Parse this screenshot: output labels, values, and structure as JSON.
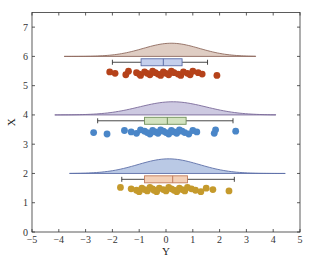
{
  "chart_data": {
    "type": "raincloud",
    "title": "",
    "xlabel": "Y",
    "ylabel": "X",
    "xlim": [
      -5,
      5
    ],
    "ylim": [
      0,
      7.5
    ],
    "xticks": [
      -5,
      -4,
      -3,
      -2,
      -1,
      0,
      1,
      2,
      3,
      4,
      5
    ],
    "yticks": [
      0,
      1,
      2,
      3,
      4,
      5,
      6,
      7
    ],
    "grid": false,
    "legend": null,
    "series": [
      {
        "name": "group-1",
        "baseline": 2,
        "box_y": 1.8,
        "dots_y": 1.45,
        "density_color": "#aebfe0",
        "density_edge": "#5d6fa8",
        "box_fill": "#f4d1b8",
        "box_edge": "#c07a5a",
        "dot_color": "#c59a2c",
        "density": {
          "x_min": -3.6,
          "x_max": 4.45,
          "mu": 0.1,
          "sigma": 1.15,
          "peak": 0.5
        },
        "box": {
          "whisker_low": -1.65,
          "q1": -0.8,
          "median": 0.25,
          "q3": 0.8,
          "whisker_high": 2.55
        },
        "points": [
          -1.7,
          -1.3,
          -1.1,
          -1.0,
          -0.9,
          -0.8,
          -0.7,
          -0.6,
          -0.5,
          -0.45,
          -0.35,
          -0.25,
          -0.1,
          0.0,
          0.1,
          0.2,
          0.3,
          0.4,
          0.5,
          0.6,
          0.7,
          0.8,
          0.95,
          1.1,
          1.3,
          1.5,
          1.75,
          2.35
        ]
      },
      {
        "name": "group-2",
        "baseline": 4,
        "box_y": 3.8,
        "dots_y": 3.42,
        "density_color": "#c4c0dc",
        "density_edge": "#7a6a9a",
        "box_fill": "#d3e3c0",
        "box_edge": "#6f8f5a",
        "dot_color": "#4a86c8",
        "density": {
          "x_min": -4.15,
          "x_max": 4.1,
          "mu": 0.25,
          "sigma": 1.25,
          "peak": 0.45
        },
        "box": {
          "whisker_low": -2.55,
          "q1": -0.8,
          "median": 0.05,
          "q3": 0.75,
          "whisker_high": 2.5
        },
        "points": [
          -2.7,
          -2.2,
          -1.55,
          -1.3,
          -1.1,
          -0.95,
          -0.8,
          -0.7,
          -0.6,
          -0.5,
          -0.4,
          -0.3,
          -0.2,
          -0.1,
          0.0,
          0.1,
          0.2,
          0.3,
          0.4,
          0.5,
          0.6,
          0.7,
          0.85,
          1.0,
          1.15,
          1.8,
          1.85,
          2.6
        ]
      },
      {
        "name": "group-3",
        "baseline": 6,
        "box_y": 5.8,
        "dots_y": 5.42,
        "density_color": "#d9c4b8",
        "density_edge": "#8e6a5e",
        "box_fill": "#c4cfec",
        "box_edge": "#5d6fa8",
        "dot_color": "#b5421a",
        "density": {
          "x_min": -3.8,
          "x_max": 3.35,
          "mu": 0.2,
          "sigma": 1.05,
          "peak": 0.45
        },
        "box": {
          "whisker_low": -2.0,
          "q1": -0.93,
          "median": -0.1,
          "q3": 0.6,
          "whisker_high": 1.55
        },
        "points": [
          -2.1,
          -1.9,
          -1.5,
          -1.4,
          -1.1,
          -1.0,
          -0.95,
          -0.8,
          -0.7,
          -0.6,
          -0.5,
          -0.4,
          -0.3,
          -0.2,
          -0.1,
          0.0,
          0.1,
          0.2,
          0.3,
          0.45,
          0.55,
          0.65,
          0.8,
          0.9,
          1.0,
          1.2,
          1.35,
          1.9
        ]
      }
    ]
  },
  "axes": {
    "xlabel": "Y",
    "ylabel": "X",
    "xtick_labels": [
      "−5",
      "−4",
      "−3",
      "−2",
      "−1",
      "0",
      "1",
      "2",
      "3",
      "4",
      "5"
    ],
    "ytick_labels": [
      "0",
      "1",
      "2",
      "3",
      "4",
      "5",
      "6",
      "7"
    ]
  }
}
